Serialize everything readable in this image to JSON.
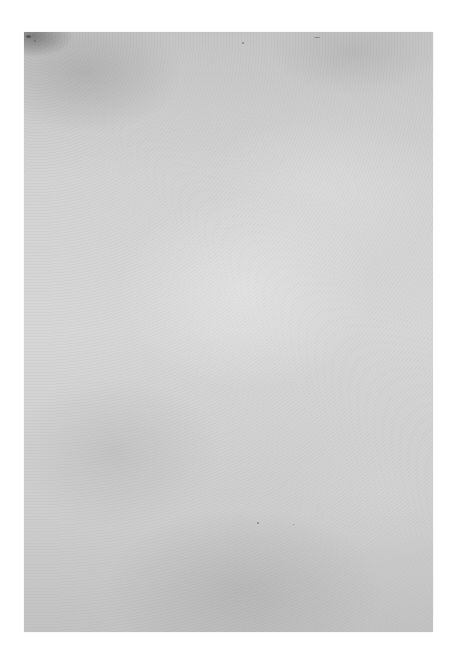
{
  "scene": {
    "description": "Blank textured gray paper sheet on white background",
    "background_color": "#ffffff",
    "paper": {
      "base_color": "#cfcfcf",
      "edge_color": "#c2c2c2",
      "highlight_color": "#e6e6e6",
      "text": ""
    }
  }
}
